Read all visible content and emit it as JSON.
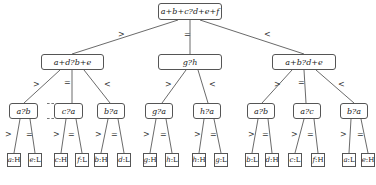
{
  "diagram": {
    "type": "decision-tree",
    "root": {
      "label": "a+b+c?d+e+f"
    },
    "level2": [
      {
        "label": "a+d?b+e",
        "edge": ">"
      },
      {
        "label": "g?h",
        "edge": "="
      },
      {
        "label": "a+b?d+e",
        "edge": "<"
      }
    ],
    "level3": [
      {
        "label": "a?b",
        "edge": ">",
        "parent": 0
      },
      {
        "label": "c?a",
        "edge": "=",
        "parent": 0
      },
      {
        "label": "b?a",
        "edge": "<",
        "parent": 0
      },
      {
        "label": "g?a",
        "edge": ">",
        "parent": 1
      },
      {
        "label": "h?a",
        "edge": "<",
        "parent": 1
      },
      {
        "label": "a?b",
        "edge": ">",
        "parent": 2
      },
      {
        "label": "a?c",
        "edge": "=",
        "parent": 2
      },
      {
        "label": "b?a",
        "edge": "<",
        "parent": 2
      }
    ],
    "leaves": [
      {
        "var": "a",
        "val": "H",
        "edge": ">"
      },
      {
        "var": "e",
        "val": "L",
        "edge": "="
      },
      {
        "var": "c",
        "val": "H",
        "edge": ">"
      },
      {
        "var": "f",
        "val": "L",
        "edge": "="
      },
      {
        "var": "b",
        "val": "H",
        "edge": ">"
      },
      {
        "var": "d",
        "val": "L",
        "edge": "="
      },
      {
        "var": "g",
        "val": "H",
        "edge": ">"
      },
      {
        "var": "h",
        "val": "L",
        "edge": "="
      },
      {
        "var": "h",
        "val": "H",
        "edge": ">"
      },
      {
        "var": "g",
        "val": "L",
        "edge": "="
      },
      {
        "var": "b",
        "val": "L",
        "edge": ">"
      },
      {
        "var": "d",
        "val": "H",
        "edge": "="
      },
      {
        "var": "c",
        "val": "L",
        "edge": ">"
      },
      {
        "var": "f",
        "val": "H",
        "edge": "="
      },
      {
        "var": "a",
        "val": "L",
        "edge": ">"
      },
      {
        "var": "e",
        "val": "H",
        "edge": "="
      }
    ],
    "separator": ":"
  }
}
